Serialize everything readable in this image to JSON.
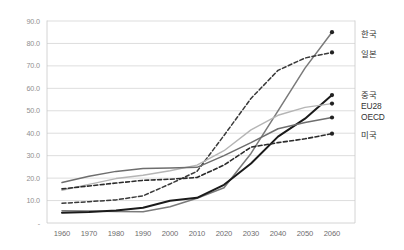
{
  "chart_data": {
    "type": "line",
    "title": "",
    "subtitle": "",
    "xlabel": "",
    "ylabel": "",
    "x": [
      1960,
      1970,
      1980,
      1990,
      2000,
      2010,
      2020,
      2030,
      2040,
      2050,
      2060
    ],
    "xlim": [
      1960,
      2060
    ],
    "ylim": [
      0,
      90
    ],
    "yticks": [
      0,
      10,
      20,
      30,
      40,
      50,
      60,
      70,
      80,
      90
    ],
    "ytick_labels": [
      "-",
      "10.0",
      "20.0",
      "30.0",
      "40.0",
      "50.0",
      "60.0",
      "70.0",
      "80.0",
      "90.0"
    ],
    "xtick_labels": [
      "1960",
      "1970",
      "1980",
      "1990",
      "2000",
      "2010",
      "2020",
      "2030",
      "2040",
      "2050",
      "2060"
    ],
    "grid": "horizontal",
    "legend_position": "right-of-endpoints",
    "series": [
      {
        "name": "한국",
        "color": "#7a7a7a",
        "style": "solid",
        "width": 1.5,
        "marker": "circle",
        "values": [
          5.5,
          5.3,
          5.1,
          5.0,
          7.2,
          11.0,
          15.7,
          31.0,
          50.0,
          69.0,
          85.0
        ]
      },
      {
        "name": "일본",
        "color": "#3a3a3a",
        "style": "dashed",
        "width": 1.5,
        "marker": "circle",
        "values": [
          8.8,
          9.5,
          10.3,
          12.1,
          17.4,
          23.0,
          39.0,
          55.5,
          68.0,
          73.5,
          76.0
        ]
      },
      {
        "name": "중국",
        "color": "#1a1a1a",
        "style": "solid",
        "width": 2.0,
        "marker": "circle",
        "values": [
          4.6,
          4.9,
          5.6,
          6.8,
          9.9,
          11.2,
          17.0,
          26.5,
          38.5,
          46.5,
          57.0
        ]
      },
      {
        "name": "EU28",
        "color": "#b5b5b5",
        "style": "solid",
        "width": 1.4,
        "marker": "circle",
        "values": [
          14.6,
          17.2,
          19.8,
          21.3,
          23.3,
          25.8,
          32.2,
          41.5,
          48.0,
          51.5,
          53.2
        ]
      },
      {
        "name": "OECD",
        "color": "#6e6e6e",
        "style": "solid",
        "width": 1.5,
        "marker": "circle",
        "values": [
          18.0,
          20.8,
          23.0,
          24.3,
          24.5,
          24.8,
          30.0,
          35.8,
          42.0,
          44.8,
          47.0
        ]
      },
      {
        "name": "미국",
        "color": "#2b2b2b",
        "style": "dashed",
        "width": 1.6,
        "marker": "circle",
        "values": [
          15.2,
          16.5,
          17.8,
          19.0,
          19.5,
          20.3,
          25.8,
          33.8,
          35.8,
          37.5,
          39.8
        ]
      }
    ]
  },
  "legend": {
    "entries": [
      {
        "label": "한국"
      },
      {
        "label": "일본"
      },
      {
        "label": "중국"
      },
      {
        "label": "EU28"
      },
      {
        "label": "OECD"
      },
      {
        "label": "미국"
      }
    ]
  },
  "colors": {
    "grid": "#d4d4d4",
    "axis": "#c9c9c9",
    "tick_text": "#8f8f8f",
    "xtick_text": "#6d6d6d",
    "legend_text": "#333333",
    "background": "#ffffff"
  }
}
